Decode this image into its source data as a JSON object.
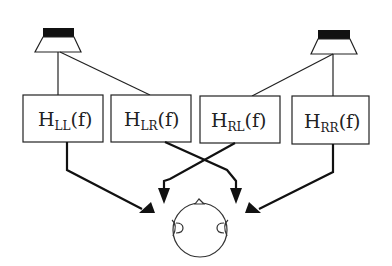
{
  "diagram": {
    "speakers": [
      {
        "id": "left-speaker",
        "label": ""
      },
      {
        "id": "right-speaker",
        "label": ""
      }
    ],
    "transfer_functions": [
      {
        "id": "hll",
        "main": "H",
        "sub": "LL",
        "arg": "(f)"
      },
      {
        "id": "hlr",
        "main": "H",
        "sub": "LR",
        "arg": "(f)"
      },
      {
        "id": "hrl",
        "main": "H",
        "sub": "RL",
        "arg": "(f)"
      },
      {
        "id": "hrr",
        "main": "H",
        "sub": "RR",
        "arg": "(f)"
      }
    ],
    "connections": [
      {
        "from": "left-speaker",
        "to": "hll"
      },
      {
        "from": "left-speaker",
        "to": "hlr"
      },
      {
        "from": "right-speaker",
        "to": "hrl"
      },
      {
        "from": "right-speaker",
        "to": "hrr"
      },
      {
        "from": "hll",
        "to": "left-ear"
      },
      {
        "from": "hlr",
        "to": "right-ear"
      },
      {
        "from": "hrl",
        "to": "left-ear"
      },
      {
        "from": "hrr",
        "to": "right-ear"
      }
    ],
    "listener": {
      "id": "listener-head",
      "ears": [
        "left-ear",
        "right-ear"
      ]
    },
    "colors": {
      "stroke": "#222222",
      "fill_dark": "#111111",
      "background": "#ffffff"
    }
  }
}
